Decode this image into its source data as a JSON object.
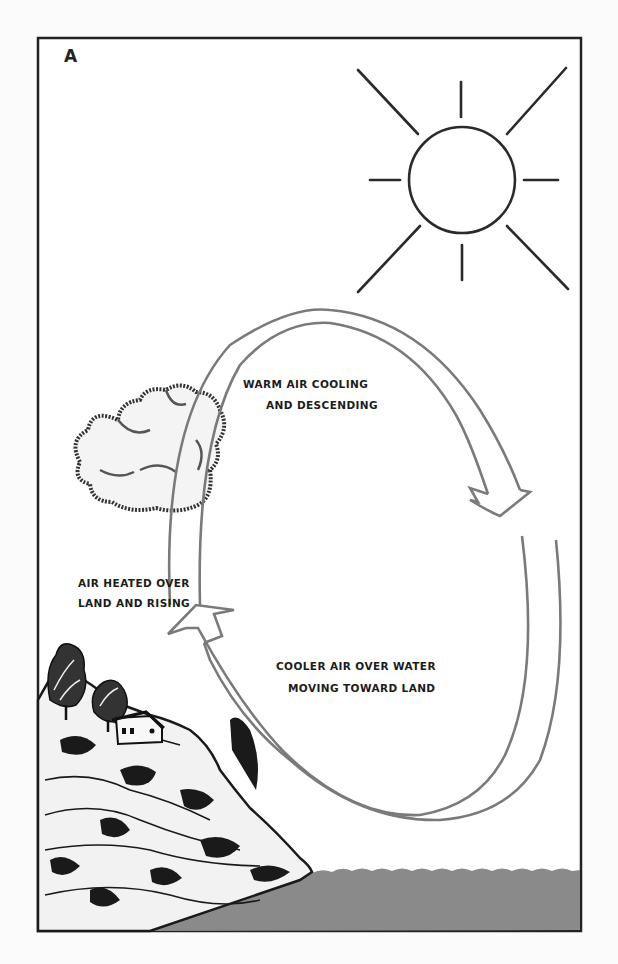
{
  "figure": {
    "panel_letter": "A",
    "colors": {
      "ink": "#222222",
      "arrow_stroke": "#7a7a7a",
      "water": "#8a8a8a",
      "paper": "#fbfbfb"
    }
  },
  "labels": {
    "warm_air": [
      "WARM AIR COOLING",
      "AND DESCENDING"
    ],
    "heated_air": [
      "AIR HEATED OVER",
      "LAND AND RISING"
    ],
    "cooler_air": [
      "COOLER AIR OVER WATER",
      "MOVING TOWARD LAND"
    ]
  },
  "elements": {
    "sun": "sun-icon",
    "cloud": "cloud-icon",
    "land": "hillside-with-trees-and-house",
    "water": "sea-surface",
    "circulation": "circular-airflow-arrows"
  }
}
